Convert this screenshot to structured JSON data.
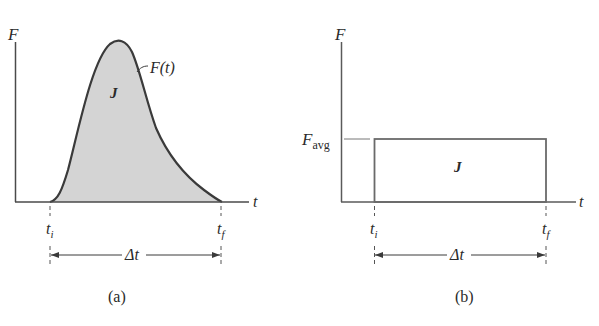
{
  "figure": {
    "panel_a": {
      "caption": "(a)",
      "y_axis_label": "F",
      "x_axis_label": "t",
      "curve_label": "F(t)",
      "area_label": "J",
      "t_initial_label": "t",
      "t_initial_sub": "i",
      "t_final_label": "t",
      "t_final_sub": "f",
      "interval_label": "Δt",
      "fill_color": "#d4d4d4",
      "line_color": "#3a3a3a"
    },
    "panel_b": {
      "caption": "(b)",
      "y_axis_label": "F",
      "x_axis_label": "t",
      "level_label": "F",
      "level_sub": "avg",
      "area_label": "J",
      "t_initial_label": "t",
      "t_initial_sub": "i",
      "t_final_label": "t",
      "t_final_sub": "f",
      "interval_label": "Δt",
      "line_color": "#6a6a6a"
    }
  }
}
